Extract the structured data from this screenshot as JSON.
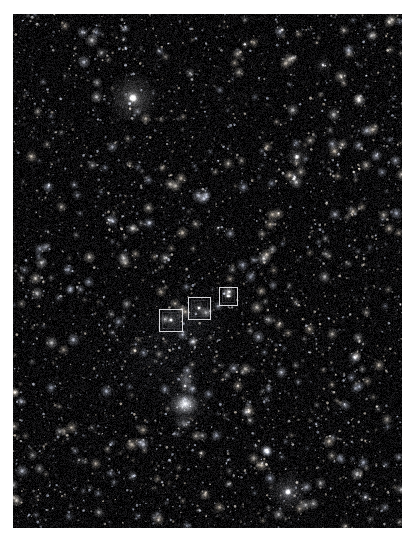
{
  "image": {
    "kind": "astronomical-sky-photograph",
    "subject": "Orion constellation star field",
    "background_color": "#050506",
    "border_color": "#ffffff",
    "frame": {
      "x": 13,
      "y": 14,
      "width": 389,
      "height": 514
    }
  },
  "markers": [
    {
      "id": "marker-left",
      "label": "",
      "x": 146,
      "y": 295,
      "width": 24,
      "height": 23
    },
    {
      "id": "marker-middle",
      "label": "",
      "x": 175,
      "y": 283,
      "width": 23,
      "height": 23
    },
    {
      "id": "marker-right",
      "label": "",
      "x": 206,
      "y": 273,
      "width": 19,
      "height": 19
    }
  ],
  "bright_objects": [
    {
      "name": "bright-star-upper-left",
      "x": 120,
      "y": 84,
      "radius": 4.2,
      "glow": 26,
      "brightness": 1.0,
      "tint": "#ffffff"
    },
    {
      "name": "bright-star-lower-right",
      "x": 275,
      "y": 478,
      "radius": 3.4,
      "glow": 20,
      "brightness": 0.92,
      "tint": "#f4f6ff"
    },
    {
      "name": "star-upper-right",
      "x": 284,
      "y": 143,
      "radius": 2.6,
      "glow": 13,
      "brightness": 0.82,
      "tint": "#ffffff"
    },
    {
      "name": "star-top-right",
      "x": 310,
      "y": 51,
      "radius": 1.9,
      "glow": 9,
      "brightness": 0.68,
      "tint": "#f8f8ff"
    },
    {
      "name": "star-belt-left",
      "x": 158,
      "y": 306,
      "radius": 2.0,
      "glow": 9,
      "brightness": 0.85,
      "tint": "#ffffff"
    },
    {
      "name": "star-belt-middle",
      "x": 186,
      "y": 294,
      "radius": 1.9,
      "glow": 8,
      "brightness": 0.85,
      "tint": "#ffffff"
    },
    {
      "name": "star-belt-right",
      "x": 215,
      "y": 282,
      "radius": 1.6,
      "glow": 7,
      "brightness": 0.8,
      "tint": "#ffffff"
    },
    {
      "name": "star-sword-upper",
      "x": 172,
      "y": 372,
      "radius": 1.7,
      "glow": 8,
      "brightness": 0.66,
      "tint": "#ffffff"
    },
    {
      "name": "star-mid-field-a",
      "x": 205,
      "y": 214,
      "radius": 1.4,
      "glow": 6,
      "brightness": 0.55,
      "tint": "#ffffff"
    },
    {
      "name": "star-mid-field-b",
      "x": 96,
      "y": 206,
      "radius": 1.3,
      "glow": 5,
      "brightness": 0.5,
      "tint": "#ffffff"
    },
    {
      "name": "star-lower-left",
      "x": 66,
      "y": 446,
      "radius": 1.5,
      "glow": 6,
      "brightness": 0.55,
      "tint": "#ffffff"
    },
    {
      "name": "star-lower-mid",
      "x": 243,
      "y": 432,
      "radius": 1.3,
      "glow": 5,
      "brightness": 0.52,
      "tint": "#ffffff"
    },
    {
      "name": "star-right-edge",
      "x": 350,
      "y": 330,
      "radius": 1.3,
      "glow": 5,
      "brightness": 0.5,
      "tint": "#ffffff"
    },
    {
      "name": "star-top-left",
      "x": 52,
      "y": 62,
      "radius": 1.2,
      "glow": 5,
      "brightness": 0.46,
      "tint": "#ffffff"
    }
  ],
  "nebulae": [
    {
      "name": "orion-nebula-core",
      "x": 172,
      "y": 390,
      "rx": 15,
      "ry": 12,
      "brightness": 0.85,
      "tint": "#eef0f4"
    },
    {
      "name": "orion-nebula-halo",
      "x": 172,
      "y": 391,
      "rx": 26,
      "ry": 22,
      "brightness": 0.3,
      "tint": "#d8dce6"
    },
    {
      "name": "running-man-nebula",
      "x": 173,
      "y": 365,
      "rx": 13,
      "ry": 11,
      "brightness": 0.42,
      "tint": "#dfe3ee"
    },
    {
      "name": "sword-lower-glow",
      "x": 170,
      "y": 409,
      "rx": 11,
      "ry": 9,
      "brightness": 0.38,
      "tint": "#e4e7ef"
    },
    {
      "name": "belt-region-haze",
      "x": 175,
      "y": 305,
      "rx": 46,
      "ry": 34,
      "brightness": 0.13,
      "tint": "#b9c0d2"
    },
    {
      "name": "diffuse-field-haze",
      "x": 150,
      "y": 340,
      "rx": 85,
      "ry": 70,
      "brightness": 0.07,
      "tint": "#9aa2b8"
    }
  ],
  "starfield": {
    "seed": 20240117,
    "faint_star_count": 5200,
    "mid_star_count": 520,
    "noise_level": 0.17,
    "max_faint_radius": 1.15,
    "tints": [
      "#ffffff",
      "#fdf6ea",
      "#e8eeff",
      "#fff2e0",
      "#dfe8ff"
    ]
  }
}
